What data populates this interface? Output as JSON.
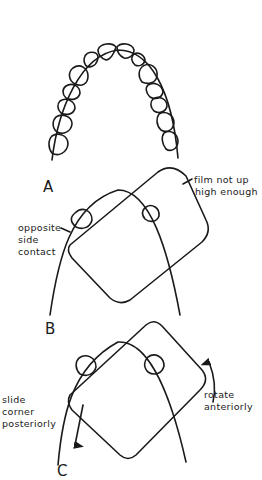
{
  "figure": {
    "panels": [
      {
        "id": "A",
        "label": "A",
        "description": "dental arch (maxillary teeth outline)"
      },
      {
        "id": "B",
        "label": "B",
        "annotations": [
          "film not up",
          "high enough",
          "opposite",
          "side",
          "contact"
        ]
      },
      {
        "id": "C",
        "label": "C",
        "annotations": [
          "slide",
          "corner",
          "posteriorly",
          "rotate",
          "anteriorly"
        ]
      }
    ]
  },
  "labels": {
    "A": "A",
    "B": "B",
    "C": "C",
    "film_line1": "film not up",
    "film_line2": "high enough",
    "opp_line1": "opposite",
    "opp_line2": "side",
    "opp_line3": "contact",
    "slide_line1": "slide",
    "slide_line2": "corner",
    "slide_line3": "posteriorly",
    "rotate_line1": "rotate",
    "rotate_line2": "anteriorly"
  },
  "colors": {
    "ink": "#1a1a1a",
    "background": "#ffffff"
  }
}
